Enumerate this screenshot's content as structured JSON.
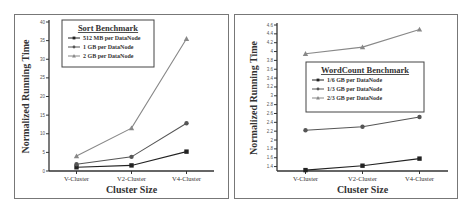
{
  "chart_data": [
    {
      "type": "line",
      "title": "Sort Benchmark",
      "xlabel": "Cluster Size",
      "ylabel": "Normalized Running Time",
      "categories": [
        "V-Cluster",
        "V2-Cluster",
        "V4-Cluster"
      ],
      "ylim": [
        0,
        40
      ],
      "yticks": [
        0,
        5,
        10,
        15,
        20,
        25,
        30,
        35,
        40
      ],
      "grid": false,
      "legend_position": "upper-left inside",
      "series": [
        {
          "name": "512 MB per DataNode",
          "marker": "square",
          "color": "#222222",
          "values": [
            1.0,
            1.5,
            5.2
          ]
        },
        {
          "name": "1 GB per DataNode",
          "marker": "circle",
          "color": "#555555",
          "values": [
            1.8,
            3.8,
            12.8
          ]
        },
        {
          "name": "2 GB per DataNode",
          "marker": "triangle",
          "color": "#888888",
          "values": [
            4.0,
            11.5,
            35.5
          ]
        }
      ]
    },
    {
      "type": "line",
      "title": "WordCount Benchmark",
      "xlabel": "Cluster Size",
      "ylabel": "Normalized Running Time",
      "categories": [
        "V-Cluster",
        "V2-Cluster",
        "V4-Cluster"
      ],
      "ylim": [
        1.3,
        4.6
      ],
      "yticks": [
        1.4,
        1.6,
        1.8,
        2.0,
        2.2,
        2.4,
        2.6,
        2.8,
        3.0,
        3.2,
        3.4,
        3.6,
        3.8,
        4.0,
        4.2,
        4.4,
        4.6
      ],
      "grid": false,
      "legend_position": "center-right inside",
      "series": [
        {
          "name": "1/6 GB per DataNode",
          "marker": "square",
          "color": "#222222",
          "values": [
            1.32,
            1.42,
            1.58
          ]
        },
        {
          "name": "1/3 GB per DataNode",
          "marker": "circle",
          "color": "#555555",
          "values": [
            2.22,
            2.3,
            2.52
          ]
        },
        {
          "name": "2/3 GB per DataNode",
          "marker": "triangle",
          "color": "#888888",
          "values": [
            3.95,
            4.1,
            4.5
          ]
        }
      ]
    }
  ]
}
